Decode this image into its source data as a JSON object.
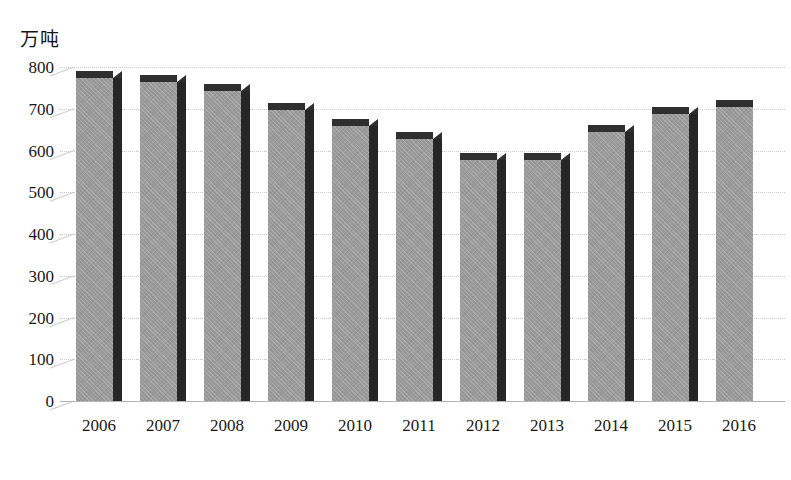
{
  "chart_data": {
    "type": "bar",
    "title": "",
    "subtitle": "",
    "xlabel": "",
    "ylabel": "万吨",
    "unit_caption": "万吨",
    "categories": [
      "2006",
      "2007",
      "2008",
      "2009",
      "2010",
      "2011",
      "2012",
      "2013",
      "2014",
      "2015",
      "2016"
    ],
    "values": [
      790,
      780,
      760,
      715,
      675,
      645,
      595,
      595,
      660,
      705,
      720
    ],
    "ylim": [
      0,
      800
    ],
    "ytick_labels": [
      "800",
      "700",
      "600",
      "500",
      "400",
      "300",
      "200",
      "100",
      "0"
    ],
    "ytick_values": [
      800,
      700,
      600,
      500,
      400,
      300,
      200,
      100,
      0
    ],
    "ytick_step": 100,
    "grid": true,
    "legend": "none",
    "style": "3d-column",
    "series": [
      {
        "name": "",
        "values": [
          790,
          780,
          760,
          715,
          675,
          645,
          595,
          595,
          660,
          705,
          720
        ]
      }
    ],
    "colors": {
      "bar_face": "#9b9b9b",
      "bar_side": "#262626",
      "bar_top": "#2f2f2f",
      "gridline": "#c9c9c9",
      "axis": "#b4b4b4",
      "text": "#181818"
    }
  }
}
